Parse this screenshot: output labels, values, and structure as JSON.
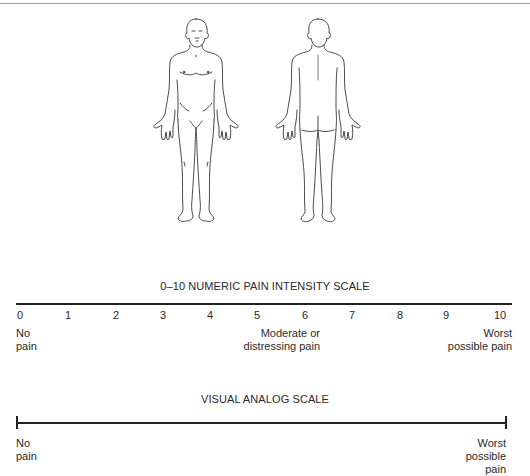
{
  "figures": {
    "front_label": "front-body-outline",
    "back_label": "back-body-outline",
    "line_color": "#1e1e1e"
  },
  "numeric_scale": {
    "title": "0–10 NUMERIC PAIN INTENSITY SCALE",
    "ticks": [
      "0",
      "1",
      "2",
      "3",
      "4",
      "5",
      "6",
      "7",
      "8",
      "9",
      "10"
    ],
    "anchors": {
      "low_line1": "No",
      "low_line2": "pain",
      "mid_line1": "Moderate or",
      "mid_line2": "distressing pain",
      "high_line1": "Worst",
      "high_line2": "possible pain"
    }
  },
  "visual_analog_scale": {
    "title": "VISUAL ANALOG SCALE",
    "anchors": {
      "low_line1": "No",
      "low_line2": "pain",
      "high_line1": "Worst",
      "high_line2": "possible",
      "high_line3": "pain"
    }
  }
}
